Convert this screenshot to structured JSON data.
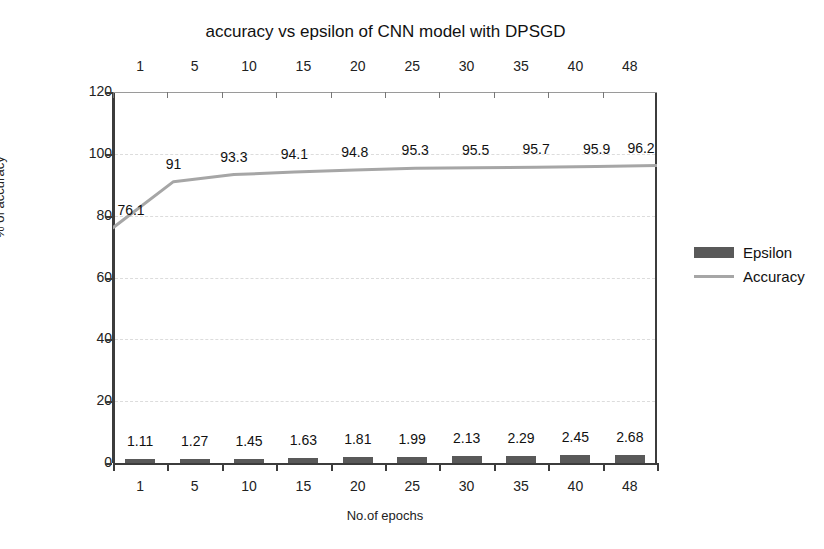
{
  "chart_data": {
    "type": "bar",
    "title": "accuracy vs epsilon of CNN model with DPSGD",
    "xlabel": "No.of epochs",
    "ylabel": "% of accuracy",
    "categories": [
      "1",
      "5",
      "10",
      "15",
      "20",
      "25",
      "30",
      "35",
      "40",
      "48"
    ],
    "top_axis_labels": [
      "1",
      "5",
      "10",
      "15",
      "20",
      "25",
      "30",
      "35",
      "40",
      "48"
    ],
    "ylim": [
      0,
      120
    ],
    "yticks": [
      "0",
      "20",
      "40",
      "60",
      "80",
      "100",
      "120"
    ],
    "grid": true,
    "legend_position": "right",
    "series": [
      {
        "name": "Epsilon",
        "kind": "bar",
        "color": "#595959",
        "values": [
          1.11,
          1.27,
          1.45,
          1.63,
          1.81,
          1.99,
          2.13,
          2.29,
          2.45,
          2.68
        ],
        "labels": [
          "1.11",
          "1.27",
          "1.45",
          "1.63",
          "1.81",
          "1.99",
          "2.13",
          "2.29",
          "2.45",
          "2.68"
        ]
      },
      {
        "name": "Accuracy",
        "kind": "line",
        "color": "#a6a6a6",
        "values": [
          76.1,
          91,
          93.3,
          94.1,
          94.8,
          95.3,
          95.5,
          95.7,
          95.9,
          96.2
        ],
        "labels": [
          "76.1",
          "91",
          "93.3",
          "94.1",
          "94.8",
          "95.3",
          "95.5",
          "95.7",
          "95.9",
          "96.2"
        ]
      }
    ]
  },
  "legend": {
    "items": [
      {
        "label": "Epsilon",
        "swatch": "bar-swatch"
      },
      {
        "label": "Accuracy",
        "swatch": "line-swatch"
      }
    ]
  }
}
